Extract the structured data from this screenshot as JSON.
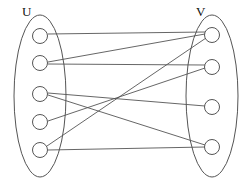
{
  "diagram": {
    "type": "bipartite-graph",
    "title": "",
    "background_color": "#ffffff",
    "stroke_color": "#555555",
    "label_color": "#111111",
    "sets": {
      "left": {
        "label": "U",
        "label_x": 22,
        "label_y": 16,
        "hull": {
          "cx": 40,
          "cy": 96,
          "rx": 26,
          "ry": 81
        },
        "nodes": [
          {
            "id": "u1",
            "cx": 40,
            "cy": 36,
            "r": 7.5
          },
          {
            "id": "u2",
            "cx": 40,
            "cy": 63,
            "r": 7.5
          },
          {
            "id": "u3",
            "cx": 40,
            "cy": 94,
            "r": 7.5
          },
          {
            "id": "u4",
            "cx": 40,
            "cy": 122,
            "r": 7.5
          },
          {
            "id": "u5",
            "cx": 40,
            "cy": 150,
            "r": 7.5
          }
        ]
      },
      "right": {
        "label": "V",
        "label_x": 196,
        "label_y": 16,
        "hull": {
          "cx": 212,
          "cy": 96,
          "rx": 26,
          "ry": 81
        },
        "nodes": [
          {
            "id": "v1",
            "cx": 212,
            "cy": 35,
            "r": 7.5
          },
          {
            "id": "v2",
            "cx": 212,
            "cy": 67,
            "r": 7.5
          },
          {
            "id": "v3",
            "cx": 212,
            "cy": 107,
            "r": 7.5
          },
          {
            "id": "v4",
            "cx": 212,
            "cy": 147,
            "r": 7.5
          }
        ]
      }
    },
    "edges": [
      {
        "id": "e1",
        "from": "u1",
        "to": "v1",
        "x1": 48,
        "y1": 34,
        "x2": 205,
        "y2": 32
      },
      {
        "id": "e2",
        "from": "u2",
        "to": "v1",
        "x1": 48,
        "y1": 62,
        "x2": 205,
        "y2": 34
      },
      {
        "id": "e3",
        "from": "u2",
        "to": "v2",
        "x1": 48,
        "y1": 64,
        "x2": 205,
        "y2": 65
      },
      {
        "id": "e4",
        "from": "u3",
        "to": "v3",
        "x1": 48,
        "y1": 93,
        "x2": 205,
        "y2": 106
      },
      {
        "id": "e5",
        "from": "u3",
        "to": "v4",
        "x1": 48,
        "y1": 95,
        "x2": 205,
        "y2": 145
      },
      {
        "id": "e6",
        "from": "u4",
        "to": "v2",
        "x1": 48,
        "y1": 121,
        "x2": 205,
        "y2": 68
      },
      {
        "id": "e7",
        "from": "u5",
        "to": "v1",
        "x1": 47,
        "y1": 146,
        "x2": 206,
        "y2": 38
      },
      {
        "id": "e8",
        "from": "u5",
        "to": "v4",
        "x1": 48,
        "y1": 150,
        "x2": 205,
        "y2": 147
      }
    ],
    "edge_count": 8,
    "left_node_count": 5,
    "right_node_count": 4
  }
}
